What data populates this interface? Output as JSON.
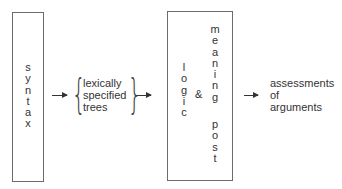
{
  "diagram": {
    "syntax_box": {
      "letters": [
        "s",
        "y",
        "n",
        "t",
        "a",
        "x"
      ]
    },
    "trees": {
      "lines": [
        "lexically",
        "specified",
        "trees"
      ]
    },
    "logic_box": {
      "logic_letters": [
        "l",
        "o",
        "g",
        "i",
        "c"
      ],
      "ampersand": "&",
      "meaning_letters": [
        "m",
        "e",
        "a",
        "n",
        "i",
        "n",
        "g"
      ],
      "post_letters": [
        "p",
        "o",
        "s",
        "t"
      ]
    },
    "output": {
      "lines": [
        "assessments",
        "of",
        "arguments"
      ]
    },
    "colors": {
      "border": "#6b6b6b",
      "text": "#333333",
      "arrow": "#333333"
    }
  }
}
